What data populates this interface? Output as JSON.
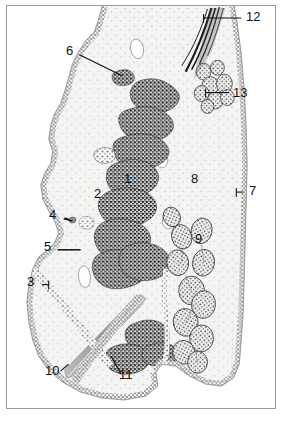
{
  "figure": {
    "kind": "histological-section-line-drawing",
    "medium": "stippled ink illustration",
    "frame_color": "#9a9a9a",
    "background_color": "#ffffff",
    "ink_color": "#2b2b2b",
    "tissue_fill_color": "#f3f3f2",
    "width_px": 284,
    "height_px": 424
  },
  "labels": [
    {
      "id": "1",
      "text": "1",
      "x": 124,
      "y": 180,
      "leader": "none",
      "target": "dark stippled elongated gland mass (central)"
    },
    {
      "id": "2",
      "text": "2",
      "x": 94,
      "y": 195,
      "leader": "none",
      "target": "pale interstitial zone left of central masses"
    },
    {
      "id": "3",
      "text": "3",
      "x": 27,
      "y": 283,
      "leader": "horizontal-right",
      "target": "stippled epithelial border, lower left lobe"
    },
    {
      "id": "4",
      "text": "4",
      "x": 49,
      "y": 216,
      "leader": "diagonal-down-right",
      "target": "small dense granule at epithelial crypt"
    },
    {
      "id": "5",
      "text": "5",
      "x": 44,
      "y": 248,
      "leader": "horizontal-right",
      "target": "stippled basal layer at mid-left margin"
    },
    {
      "id": "6",
      "text": "6",
      "x": 66,
      "y": 52,
      "leader": "diagonal-down-right",
      "target": "small isolated cell cluster, upper field"
    },
    {
      "id": "7",
      "text": "7",
      "x": 245,
      "y": 192,
      "leader": "horizontal-left",
      "target": "outer stippled boundary, right margin"
    },
    {
      "id": "8",
      "text": "8",
      "x": 190,
      "y": 180,
      "leader": "none",
      "target": "pale fibrous stroma, right field"
    },
    {
      "id": "9",
      "text": "9",
      "x": 194,
      "y": 238,
      "leader": "none",
      "target": "rounded follicle in right chain"
    },
    {
      "id": "10",
      "text": "10",
      "x": 45,
      "y": 371,
      "leader": "diagonal-up-right",
      "target": "elongated grey duct / spine at lower left"
    },
    {
      "id": "11",
      "text": "11",
      "x": 119,
      "y": 374,
      "leader": "diagonal-up-left",
      "target": "dense stippled cluster, lower central field"
    },
    {
      "id": "12",
      "text": "12",
      "x": 245,
      "y": 17,
      "leader": "horizontal-left",
      "target": "dark needle-like spindle structure at apex"
    },
    {
      "id": "13",
      "text": "13",
      "x": 231,
      "y": 92,
      "leader": "horizontal-left",
      "target": "cluster of vesicular cells, upper right"
    }
  ],
  "structure_notes": {
    "left_margin": "wavy stippled epithelial border with scalloped crypts",
    "center": "series of six to seven dark elongated stippled gland masses arranged diagonally",
    "right_margin": "long stippled outer boundary running top to bottom",
    "right_field": "chain of rounded stippled follicles descending the lower right",
    "apex": "converging dark linear spindle fibers at top center",
    "lower_left": "grey elongated duct running diagonally to lower left corner",
    "vacuoles": "several small clear oval lumina scattered through the field"
  }
}
